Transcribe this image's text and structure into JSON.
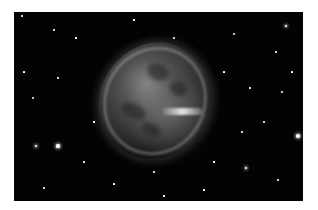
{
  "image": {
    "subject": "planetary nebula",
    "description": "Grayscale astronomical photograph of a roughly round, mottled nebula on a black star field",
    "background_color": "#030303",
    "frame_color": "#ffffff"
  },
  "stars": [
    {
      "x": 8,
      "y": 4,
      "r": 0.8
    },
    {
      "x": 40,
      "y": 18,
      "r": 0.7
    },
    {
      "x": 62,
      "y": 26,
      "r": 0.6
    },
    {
      "x": 19,
      "y": 86,
      "r": 1.0
    },
    {
      "x": 44,
      "y": 66,
      "r": 0.7
    },
    {
      "x": 22,
      "y": 134,
      "r": 1.4
    },
    {
      "x": 44,
      "y": 134,
      "r": 1.6
    },
    {
      "x": 70,
      "y": 150,
      "r": 0.7
    },
    {
      "x": 30,
      "y": 176,
      "r": 0.7
    },
    {
      "x": 100,
      "y": 172,
      "r": 0.6
    },
    {
      "x": 140,
      "y": 160,
      "r": 0.7
    },
    {
      "x": 160,
      "y": 26,
      "r": 0.8
    },
    {
      "x": 220,
      "y": 22,
      "r": 1.0
    },
    {
      "x": 272,
      "y": 14,
      "r": 1.4
    },
    {
      "x": 262,
      "y": 40,
      "r": 0.7
    },
    {
      "x": 236,
      "y": 76,
      "r": 0.7
    },
    {
      "x": 268,
      "y": 80,
      "r": 1.0
    },
    {
      "x": 250,
      "y": 110,
      "r": 0.8
    },
    {
      "x": 228,
      "y": 120,
      "r": 0.7
    },
    {
      "x": 284,
      "y": 124,
      "r": 1.8
    },
    {
      "x": 232,
      "y": 156,
      "r": 1.3
    },
    {
      "x": 264,
      "y": 168,
      "r": 0.7
    },
    {
      "x": 200,
      "y": 150,
      "r": 0.6
    },
    {
      "x": 190,
      "y": 178,
      "r": 0.6
    },
    {
      "x": 120,
      "y": 8,
      "r": 0.6
    },
    {
      "x": 210,
      "y": 60,
      "r": 0.6
    },
    {
      "x": 80,
      "y": 110,
      "r": 0.6
    },
    {
      "x": 10,
      "y": 60,
      "r": 0.6
    },
    {
      "x": 278,
      "y": 60,
      "r": 0.6
    },
    {
      "x": 150,
      "y": 184,
      "r": 0.6
    }
  ]
}
